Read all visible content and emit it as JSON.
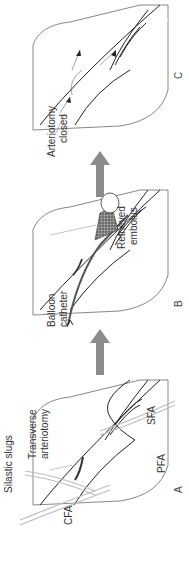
{
  "figure": {
    "orientation": "rotated-90-ccw",
    "panels": [
      {
        "id": "A",
        "label": "A",
        "annotations": {
          "silastic_slugs": "Silastic slugs",
          "transverse_line1": "Transverse",
          "transverse_line2": "arteriotomy",
          "cfa": "CFA",
          "sfa": "SFA",
          "pfa": "PFA"
        }
      },
      {
        "id": "B",
        "label": "B",
        "annotations": {
          "balloon_line1": "Balloon",
          "balloon_line2": "catheter",
          "retrieved_line1": "Retrieved",
          "retrieved_line2": "embolus"
        }
      },
      {
        "id": "C",
        "label": "C",
        "annotations": {
          "closed_line1": "Arteriotomy",
          "closed_line2": "closed"
        }
      }
    ],
    "colors": {
      "tissue_fill": "#e6e6e6",
      "vessel_stroke": "#222222",
      "arrow_fill": "#8c8c8c",
      "embolus_fill": "#6f6f6f"
    },
    "step_arrows": [
      "A-to-B",
      "B-to-C"
    ]
  }
}
